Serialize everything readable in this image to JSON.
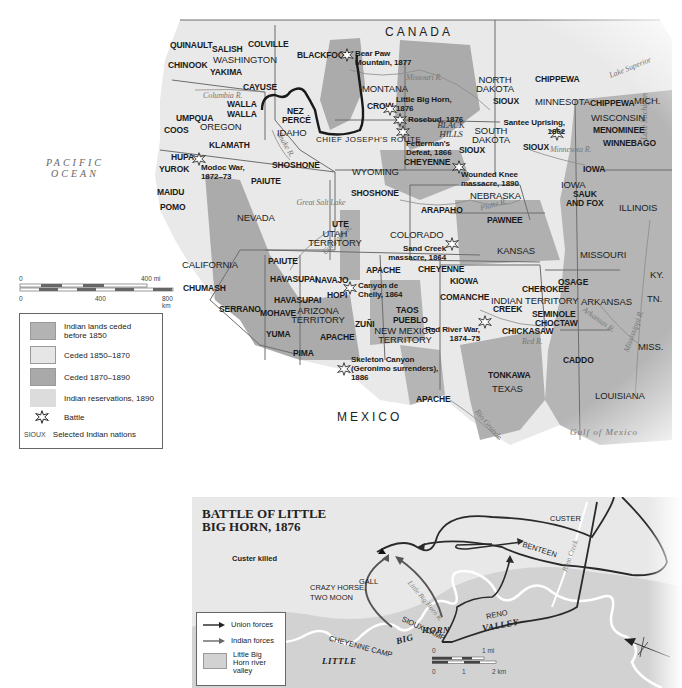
{
  "main_map": {
    "country_labels": {
      "canada": "CANADA",
      "mexico": "MEXICO"
    },
    "water_labels": {
      "pacific": "PACIFIC OCEAN",
      "gulf": "Gulf of Mexico",
      "lake_superior": "Lake Superior",
      "lake_michigan": "Lake Michigan",
      "great_salt_lake": "Great Salt Lake"
    },
    "rivers": {
      "columbia": "Columbia R.",
      "snake": "Snake R.",
      "missouri": "Missouri R.",
      "platte": "Platte R.",
      "colorado": "Colorado R.",
      "minnesota": "Minnesota R.",
      "arkansas": "Arkansas R.",
      "red": "Red R.",
      "mississippi": "Mississippi R.",
      "rio_grande": "Rio Grande"
    },
    "states": {
      "washington": "WASHINGTON",
      "oregon": "OREGON",
      "idaho": "IDAHO",
      "montana": "MONTANA",
      "wyoming": "WYOMING",
      "nevada": "NEVADA",
      "california": "CALIFORNIA",
      "utah": "UTAH TERRITORY",
      "colorado": "COLORADO",
      "arizona": "ARIZONA TERRITORY",
      "new_mexico": "NEW MEXICO TERRITORY",
      "north_dakota": "NORTH DAKOTA",
      "south_dakota": "SOUTH DAKOTA",
      "nebraska": "NEBRASKA",
      "kansas": "KANSAS",
      "indian_territory": "INDIAN TERRITORY",
      "texas": "TEXAS",
      "minnesota": "MINNESOTA",
      "wisconsin": "WISCONSIN",
      "mich": "MICH.",
      "iowa": "IOWA",
      "illinois": "ILLINOIS",
      "missouri": "MISSOURI",
      "arkansas": "ARKANSAS",
      "louisiana": "LOUISIANA",
      "ky": "KY.",
      "tn": "TN.",
      "miss": "MISS."
    },
    "nations": [
      {
        "name": "QUINAULT",
        "x": 170,
        "y": 41
      },
      {
        "name": "SALISH",
        "x": 212,
        "y": 45
      },
      {
        "name": "COLVILLE",
        "x": 248,
        "y": 40
      },
      {
        "name": "CHINOOK",
        "x": 168,
        "y": 61
      },
      {
        "name": "YAKIMA",
        "x": 210,
        "y": 68
      },
      {
        "name": "CAYUSE",
        "x": 243,
        "y": 83
      },
      {
        "name": "WALLA",
        "x": 227,
        "y": 100
      },
      {
        "name": "WALLA",
        "x": 227,
        "y": 110
      },
      {
        "name": "UMPQUA",
        "x": 176,
        "y": 114
      },
      {
        "name": "COOS",
        "x": 164,
        "y": 126
      },
      {
        "name": "KLAMATH",
        "x": 209,
        "y": 141
      },
      {
        "name": "NEZ",
        "x": 287,
        "y": 107
      },
      {
        "name": "PERCÉ",
        "x": 282,
        "y": 116
      },
      {
        "name": "BLACKFOOT",
        "x": 297,
        "y": 51
      },
      {
        "name": "HUPA",
        "x": 171,
        "y": 153
      },
      {
        "name": "YUROK",
        "x": 159,
        "y": 165
      },
      {
        "name": "MAIDU",
        "x": 157,
        "y": 188
      },
      {
        "name": "POMO",
        "x": 160,
        "y": 203
      },
      {
        "name": "SHOSHONE",
        "x": 272,
        "y": 161
      },
      {
        "name": "PAIUTE",
        "x": 251,
        "y": 177
      },
      {
        "name": "CROW",
        "x": 367,
        "y": 102
      },
      {
        "name": "CHEYENNE",
        "x": 404,
        "y": 158
      },
      {
        "name": "SHOSHONE",
        "x": 351,
        "y": 189
      },
      {
        "name": "SIOUX",
        "x": 493,
        "y": 97
      },
      {
        "name": "SIOUX",
        "x": 459,
        "y": 146
      },
      {
        "name": "SIOUX",
        "x": 523,
        "y": 143
      },
      {
        "name": "CHIPPEWA",
        "x": 535,
        "y": 75
      },
      {
        "name": "CHIPPEWA",
        "x": 590,
        "y": 99
      },
      {
        "name": "MENOMINEE",
        "x": 593,
        "y": 126
      },
      {
        "name": "WINNEBAGO",
        "x": 603,
        "y": 139
      },
      {
        "name": "IOWA",
        "x": 583,
        "y": 165
      },
      {
        "name": "SAUK",
        "x": 573,
        "y": 190
      },
      {
        "name": "AND FOX",
        "x": 566,
        "y": 199
      },
      {
        "name": "ARAPAHO",
        "x": 421,
        "y": 206
      },
      {
        "name": "PAWNEE",
        "x": 487,
        "y": 216
      },
      {
        "name": "UTE",
        "x": 332,
        "y": 220
      },
      {
        "name": "PAIUTE",
        "x": 268,
        "y": 257
      },
      {
        "name": "HAVASUPAI",
        "x": 270,
        "y": 275
      },
      {
        "name": "NAVAJO",
        "x": 315,
        "y": 276
      },
      {
        "name": "HOPI",
        "x": 327,
        "y": 291
      },
      {
        "name": "HAVASUPAI",
        "x": 274,
        "y": 296
      },
      {
        "name": "MOHAVE",
        "x": 260,
        "y": 309
      },
      {
        "name": "YUMA",
        "x": 266,
        "y": 330
      },
      {
        "name": "APACHE",
        "x": 320,
        "y": 333
      },
      {
        "name": "PIMA",
        "x": 293,
        "y": 349
      },
      {
        "name": "APACHE",
        "x": 366,
        "y": 266
      },
      {
        "name": "CHEYENNE",
        "x": 418,
        "y": 265
      },
      {
        "name": "ZUÑI",
        "x": 355,
        "y": 320
      },
      {
        "name": "TAOS",
        "x": 396,
        "y": 306
      },
      {
        "name": "PUEBLO",
        "x": 393,
        "y": 316
      },
      {
        "name": "KIOWA",
        "x": 450,
        "y": 277
      },
      {
        "name": "COMANCHE",
        "x": 440,
        "y": 293
      },
      {
        "name": "OSAGE",
        "x": 558,
        "y": 278
      },
      {
        "name": "CHEROKEE",
        "x": 522,
        "y": 285
      },
      {
        "name": "CREEK",
        "x": 493,
        "y": 305
      },
      {
        "name": "SEMINOLE",
        "x": 532,
        "y": 310
      },
      {
        "name": "CHOCTAW",
        "x": 535,
        "y": 319
      },
      {
        "name": "CHICKASAW",
        "x": 502,
        "y": 327
      },
      {
        "name": "CADDO",
        "x": 563,
        "y": 356
      },
      {
        "name": "TONKAWA",
        "x": 488,
        "y": 371
      },
      {
        "name": "APACHE",
        "x": 416,
        "y": 395
      },
      {
        "name": "CHUMASH",
        "x": 183,
        "y": 284
      },
      {
        "name": "SERRANO",
        "x": 219,
        "y": 305
      }
    ],
    "battles": [
      {
        "label": "Bear Paw Mountain, 1877",
        "x": 355,
        "y": 51
      },
      {
        "label": "Little Big Horn, 1876",
        "x": 396,
        "y": 95
      },
      {
        "label": "Rosebud, 1876",
        "x": 400,
        "y": 107
      },
      {
        "label": "Fetterman's Defeat, 1866",
        "x": 403,
        "y": 124
      },
      {
        "label": "Santee Uprising, 1862",
        "x": 497,
        "y": 118
      },
      {
        "label": "Wounded Knee massacre, 1890",
        "x": 458,
        "y": 166
      },
      {
        "label": "Modoc War, 1872–73",
        "x": 183,
        "y": 160
      },
      {
        "label": "Sand Creek massacre, 1864",
        "x": 408,
        "y": 242
      },
      {
        "label": "Canyon de Chelly, 1864",
        "x": 358,
        "y": 281
      },
      {
        "label": "Red River War, 1874–75",
        "x": 425,
        "y": 325
      },
      {
        "label": "Skeleton Canyon (Geronimo surrenders), 1886",
        "x": 351,
        "y": 355
      }
    ],
    "black_hills": "BLACK HILLS",
    "route_label": "CHIEF JOSEPH'S ROUTE"
  },
  "scale": {
    "mi_start": "0",
    "mi_end": "400 mi",
    "km_start": "0",
    "km_mid": "400",
    "km_end": "800 km"
  },
  "legend": {
    "items": [
      {
        "label": "Indian lands ceded before 1850",
        "color": "#b3b3b3"
      },
      {
        "label": "Ceded 1850–1870",
        "color": "#e6e6e6"
      },
      {
        "label": "Ceded 1870–1890",
        "color": "#a9a9a9"
      },
      {
        "label": "Indian reservations, 1890",
        "color": "#dcdcdc"
      }
    ],
    "battle_label": "Battle",
    "nation_sample": "SIOUX",
    "nation_label": "Selected Indian nations"
  },
  "inset": {
    "title": "BATTLE OF LITTLE BIG HORN, 1876",
    "title_line1": "BATTLE OF LITTLE",
    "title_line2": "BIG HORN, 1876",
    "custer_killed": "Custer killed",
    "labels": {
      "custer": "CUSTER",
      "benteen": "BENTEEN",
      "reno": "RENO",
      "gall": "GALL",
      "crazy_horse": "CRAZY HORSE,",
      "two_moon": "TWO MOON",
      "sioux_camp": "SIOUX CAMP",
      "cheyenne_camp": "CHEYENNE CAMP",
      "little": "LITTLE",
      "big": "BIG",
      "horn": "HORN",
      "valley": "VALLEY",
      "river": "Little Big Horn R.",
      "reno_creek": "Reno Creek"
    },
    "legend": {
      "union": "Union forces",
      "indian": "Indian forces",
      "valley": "Little Big Horn river valley",
      "valley_l1": "Little Big",
      "valley_l2": "Horn river",
      "valley_l3": "valley"
    },
    "scale": {
      "mi_start": "0",
      "mi_end": "1 mi",
      "km_start": "0",
      "km_mid": "1",
      "km_end": "2 km"
    }
  }
}
